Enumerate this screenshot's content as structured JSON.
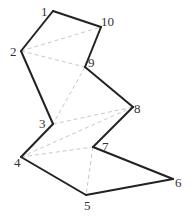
{
  "diagram": {
    "vertices": [
      {
        "id": "1",
        "label": "1"
      },
      {
        "id": "2",
        "label": "2"
      },
      {
        "id": "3",
        "label": "3"
      },
      {
        "id": "4",
        "label": "4"
      },
      {
        "id": "5",
        "label": "5"
      },
      {
        "id": "6",
        "label": "6"
      },
      {
        "id": "7",
        "label": "7"
      },
      {
        "id": "8",
        "label": "8"
      },
      {
        "id": "9",
        "label": "9"
      },
      {
        "id": "10",
        "label": "10"
      }
    ],
    "polygon_edges": [
      [
        "1",
        "2"
      ],
      [
        "2",
        "3"
      ],
      [
        "3",
        "4"
      ],
      [
        "4",
        "5"
      ],
      [
        "5",
        "6"
      ],
      [
        "6",
        "7"
      ],
      [
        "7",
        "8"
      ],
      [
        "8",
        "9"
      ],
      [
        "9",
        "10"
      ],
      [
        "10",
        "1"
      ]
    ],
    "diagonals": [
      [
        "2",
        "10"
      ],
      [
        "2",
        "9"
      ],
      [
        "9",
        "3"
      ],
      [
        "3",
        "8"
      ],
      [
        "4",
        "8"
      ],
      [
        "4",
        "7"
      ],
      [
        "7",
        "5"
      ]
    ],
    "colors": {
      "edge": "#222222",
      "diagonal": "#c8c8c8",
      "label": "#333333"
    }
  }
}
